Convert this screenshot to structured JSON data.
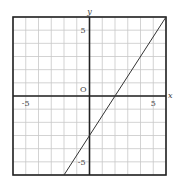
{
  "chart_data": {
    "type": "line",
    "title": "",
    "xlabel": "x",
    "ylabel": "y",
    "origin_label": "O",
    "xlim": [
      -6,
      6
    ],
    "ylim": [
      -6,
      6
    ],
    "grid": true,
    "grid_step": 1,
    "x_tick_labels": [
      {
        "value": -5,
        "label": "-5"
      },
      {
        "value": 5,
        "label": "5"
      }
    ],
    "y_tick_labels": [
      {
        "value": 5,
        "label": "5"
      },
      {
        "value": -5,
        "label": "-5"
      }
    ],
    "series": [
      {
        "name": "y = 1.5x - 3",
        "equation": "y = 1.5x - 3",
        "x": [
          -2,
          0,
          2,
          6
        ],
        "y": [
          -6,
          -3,
          0,
          6
        ]
      }
    ],
    "colors": {
      "grid": "#c8c8c8",
      "axes": "#222222",
      "frame": "#222222",
      "line": "#333333"
    }
  }
}
